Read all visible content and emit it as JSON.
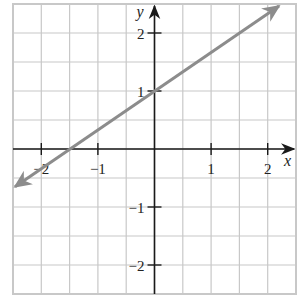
{
  "chart_data": {
    "type": "line",
    "title": "",
    "xlabel": "x",
    "ylabel": "y",
    "xlim": [
      -2.5,
      2.5
    ],
    "ylim": [
      -2.5,
      2.5
    ],
    "grid": true,
    "grid_step": 0.5,
    "x_ticks": [
      {
        "value": -2,
        "label": "−2"
      },
      {
        "value": -1,
        "label": "−1"
      },
      {
        "value": 1,
        "label": "1"
      },
      {
        "value": 2,
        "label": "2"
      }
    ],
    "y_ticks": [
      {
        "value": 2,
        "label": "2"
      },
      {
        "value": 1,
        "label": "1"
      },
      {
        "value": -1,
        "label": "−1"
      },
      {
        "value": -2,
        "label": "−2"
      }
    ],
    "series": [
      {
        "name": "line",
        "equation": "y = (2/3)x + 1",
        "slope": 0.6667,
        "intercept": 1,
        "x_intercept": -1.5,
        "x": [
          -2.5,
          2.2
        ],
        "y": [
          -0.667,
          2.467
        ],
        "color": "#8c8c8c",
        "arrows_both_ends": true
      }
    ]
  },
  "colors": {
    "grid": "#c8c8c8",
    "axis": "#1a1a1a",
    "line": "#8c8c8c",
    "background": "#ffffff"
  }
}
